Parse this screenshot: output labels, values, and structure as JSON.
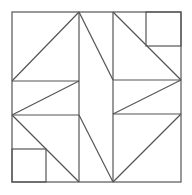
{
  "diagram": {
    "title": "",
    "type": "quilt-block",
    "stroke_color": "#555555",
    "background_color": "#ffffff",
    "outer_square": {
      "x": 12,
      "y": 12,
      "w": 169,
      "h": 170
    },
    "small_squares": [
      {
        "name": "top-right-square",
        "x": 146,
        "y": 12,
        "w": 35,
        "h": 34
      },
      {
        "name": "bottom-left-square",
        "x": 12,
        "y": 149,
        "w": 34,
        "h": 33
      }
    ],
    "lines": [
      {
        "name": "left-vertical",
        "x1": 79,
        "y1": 12,
        "x2": 79,
        "y2": 182
      },
      {
        "name": "right-vertical",
        "x1": 113,
        "y1": 12,
        "x2": 113,
        "y2": 182
      },
      {
        "name": "left-upper-horizontal",
        "x1": 12,
        "y1": 81,
        "x2": 79,
        "y2": 81
      },
      {
        "name": "left-lower-horizontal",
        "x1": 12,
        "y1": 115,
        "x2": 79,
        "y2": 115
      },
      {
        "name": "right-upper-horizontal",
        "x1": 113,
        "y1": 80,
        "x2": 181,
        "y2": 80
      },
      {
        "name": "right-lower-horizontal",
        "x1": 113,
        "y1": 114,
        "x2": 181,
        "y2": 114
      },
      {
        "name": "top-left-diagonal",
        "x1": 12,
        "y1": 81,
        "x2": 79,
        "y2": 12
      },
      {
        "name": "bottom-left-diagonal",
        "x1": 12,
        "y1": 115,
        "x2": 79,
        "y2": 182
      },
      {
        "name": "left-band-diagonal",
        "x1": 12,
        "y1": 115,
        "x2": 79,
        "y2": 81
      },
      {
        "name": "top-right-diagonal",
        "x1": 113,
        "y1": 12,
        "x2": 181,
        "y2": 80
      },
      {
        "name": "bottom-right-diagonal",
        "x1": 113,
        "y1": 182,
        "x2": 181,
        "y2": 114
      },
      {
        "name": "right-band-diagonal",
        "x1": 113,
        "y1": 114,
        "x2": 181,
        "y2": 80
      },
      {
        "name": "center-upper-diagonal",
        "x1": 79,
        "y1": 12,
        "x2": 113,
        "y2": 80
      },
      {
        "name": "center-lower-diagonal",
        "x1": 79,
        "y1": 115,
        "x2": 113,
        "y2": 182
      }
    ]
  }
}
